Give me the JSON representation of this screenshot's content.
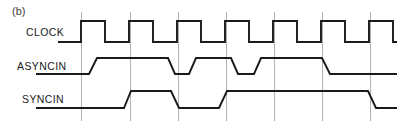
{
  "figure": {
    "panel_label": "(b)",
    "background_color": "#ffffff",
    "wave_color": "#1a1a1a",
    "grid_color": "#b3b3b3",
    "width": 399,
    "height": 126
  },
  "signals": [
    {
      "name": "CLOCK",
      "label": "CLOCK",
      "label_x": 26,
      "label_y": 36,
      "high_y": 21,
      "low_y": 42,
      "edge_style": "square",
      "path": "M 58,42 L 81,42 L 81,21 L 105,21 L 105,42 L 129,42 L 129,21 L 153,21 L 153,42 L 177,42 L 177,21 L 201,21 L 201,42 L 225,42 L 225,21 L 249,21 L 249,42 L 273,42 L 273,21 L 297,21 L 297,42 L 321,42 L 321,21 L 345,21 L 345,42 L 369,42 L 369,21 L 393,21 L 393,42 L 397,42"
    },
    {
      "name": "ASYNCIN",
      "label": "ASYNCIN",
      "label_x": 17,
      "label_y": 70,
      "high_y": 58,
      "low_y": 74,
      "edge_style": "sloped",
      "path": "M 36,74 L 89,74 L 97,58 L 168,58 L 175,74 L 189,74 L 196,58 L 231,58 L 238,74 L 254,74 L 261,58 L 322,58 L 330,74 L 397,74"
    },
    {
      "name": "SYNCIN",
      "label": "SYNCIN",
      "label_x": 22,
      "label_y": 103,
      "high_y": 91,
      "low_y": 108,
      "edge_style": "sloped",
      "path": "M 36,108 L 124,108 L 131,91 L 171,91 L 179,108 L 219,108 L 227,91 L 368,91 L 376,108 L 397,108"
    }
  ],
  "grid": {
    "top_y": 12,
    "bottom_y": 121,
    "x_positions": [
      81,
      130,
      178,
      226,
      274,
      322,
      370
    ]
  }
}
